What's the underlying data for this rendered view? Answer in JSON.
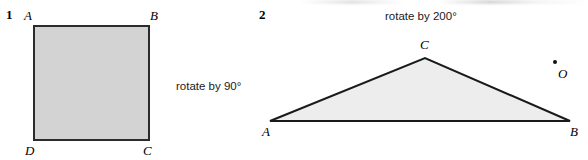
{
  "page": {
    "width": 588,
    "height": 160,
    "background": "#ffffff"
  },
  "figures": [
    {
      "number": "1",
      "shape": "square",
      "caption": "rotate by 90°",
      "rotation_degrees": 90,
      "fill_color": "#d3d3d3",
      "stroke_color": "#2b2b2b",
      "vertices": [
        {
          "label": "A",
          "corner": "top-left"
        },
        {
          "label": "B",
          "corner": "top-right"
        },
        {
          "label": "C",
          "corner": "bottom-right"
        },
        {
          "label": "D",
          "corner": "bottom-left"
        }
      ]
    },
    {
      "number": "2",
      "shape": "triangle",
      "caption": "rotate by 200°",
      "rotation_degrees": 200,
      "fill_color": "#ededed",
      "stroke_color": "#1a1a1a",
      "vertices": [
        {
          "label": "A",
          "corner": "bottom-left"
        },
        {
          "label": "B",
          "corner": "bottom-right"
        },
        {
          "label": "C",
          "corner": "apex"
        }
      ],
      "center_of_rotation": {
        "label": "O"
      }
    }
  ]
}
